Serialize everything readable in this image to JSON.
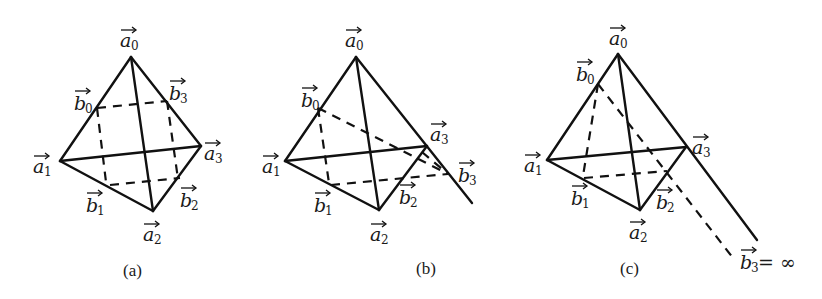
{
  "panels": [
    {
      "id": "a",
      "caption": "(a)",
      "vertices": {
        "a0": {
          "base": "a",
          "sub": "0"
        },
        "a1": {
          "base": "a",
          "sub": "1"
        },
        "a2": {
          "base": "a",
          "sub": "2"
        },
        "a3": {
          "base": "a",
          "sub": "3"
        },
        "b0": {
          "base": "b",
          "sub": "0"
        },
        "b1": {
          "base": "b",
          "sub": "1"
        },
        "b2": {
          "base": "b",
          "sub": "2"
        },
        "b3": {
          "base": "b",
          "sub": "3"
        }
      }
    },
    {
      "id": "b",
      "caption": "(b)",
      "vertices": {
        "a0": {
          "base": "a",
          "sub": "0"
        },
        "a1": {
          "base": "a",
          "sub": "1"
        },
        "a2": {
          "base": "a",
          "sub": "2"
        },
        "a3": {
          "base": "a",
          "sub": "3"
        },
        "b0": {
          "base": "b",
          "sub": "0"
        },
        "b1": {
          "base": "b",
          "sub": "1"
        },
        "b2": {
          "base": "b",
          "sub": "2"
        },
        "b3": {
          "base": "b",
          "sub": "3"
        }
      }
    },
    {
      "id": "c",
      "caption": "(c)",
      "vertices": {
        "a0": {
          "base": "a",
          "sub": "0"
        },
        "a1": {
          "base": "a",
          "sub": "1"
        },
        "a2": {
          "base": "a",
          "sub": "2"
        },
        "a3": {
          "base": "a",
          "sub": "3"
        },
        "b0": {
          "base": "b",
          "sub": "0"
        },
        "b1": {
          "base": "b",
          "sub": "1"
        },
        "b2": {
          "base": "b",
          "sub": "2"
        },
        "b3": {
          "base": "b",
          "sub": "3",
          "suffix": " = ∞"
        }
      }
    }
  ]
}
